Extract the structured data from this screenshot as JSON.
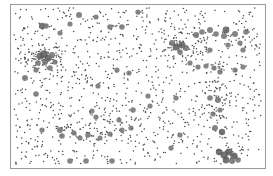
{
  "chart_data": {
    "type": "scatter",
    "title": "",
    "xlabel": "",
    "ylabel": "",
    "grid": false,
    "legend": null,
    "axes_visible": false,
    "frame": {
      "x": 10,
      "y": 4,
      "width": 255,
      "height": 164
    },
    "colors": {
      "frame": "#9a9a9a",
      "small_point": "#4a4a4a",
      "large_point": "#707070",
      "large_point_dark": "#5a5a5a",
      "background": "#ffffff"
    },
    "note": "Unlabeled point-pattern scatter. Coordinates are approximate pixel positions estimated from the screenshot. Large points are manual estimates of the visible gray blobs; the background small-point layer is generated from a seed and only approximates density, not exact positions.",
    "large_points": [
      [
        42,
        26,
        3.2
      ],
      [
        46,
        26,
        2.8
      ],
      [
        60,
        33,
        2.6
      ],
      [
        70,
        24,
        2.6
      ],
      [
        79,
        15,
        3.0
      ],
      [
        96,
        17,
        2.6
      ],
      [
        110,
        27,
        2.8
      ],
      [
        122,
        27,
        2.8
      ],
      [
        138,
        12,
        2.6
      ],
      [
        40,
        56,
        3.5
      ],
      [
        44,
        54,
        3.8
      ],
      [
        48,
        58,
        3.6
      ],
      [
        52,
        55,
        3.0
      ],
      [
        45,
        62,
        3.0
      ],
      [
        38,
        63,
        2.8
      ],
      [
        55,
        62,
        2.6
      ],
      [
        36,
        70,
        2.6
      ],
      [
        50,
        68,
        2.8
      ],
      [
        25,
        78,
        3.0
      ],
      [
        117,
        70,
        2.6
      ],
      [
        129,
        73,
        2.6
      ],
      [
        98,
        86,
        2.6
      ],
      [
        172,
        43,
        3.0
      ],
      [
        176,
        47,
        3.4
      ],
      [
        182,
        45,
        3.6
      ],
      [
        186,
        48,
        3.0
      ],
      [
        180,
        52,
        2.8
      ],
      [
        196,
        35,
        3.0
      ],
      [
        202,
        32,
        2.8
      ],
      [
        210,
        30,
        3.0
      ],
      [
        216,
        34,
        2.8
      ],
      [
        224,
        36,
        3.0
      ],
      [
        226,
        30,
        3.4
      ],
      [
        235,
        34,
        3.0
      ],
      [
        228,
        45,
        2.6
      ],
      [
        240,
        43,
        2.6
      ],
      [
        243,
        50,
        2.6
      ],
      [
        246,
        32,
        2.8
      ],
      [
        210,
        50,
        2.6
      ],
      [
        190,
        63,
        2.6
      ],
      [
        198,
        67,
        2.6
      ],
      [
        206,
        66,
        2.6
      ],
      [
        214,
        68,
        2.6
      ],
      [
        220,
        72,
        2.6
      ],
      [
        235,
        70,
        2.6
      ],
      [
        243,
        67,
        2.6
      ],
      [
        36,
        94,
        2.8
      ],
      [
        92,
        111,
        2.6
      ],
      [
        96,
        117,
        2.6
      ],
      [
        119,
        120,
        2.6
      ],
      [
        60,
        130,
        3.0
      ],
      [
        62,
        136,
        2.8
      ],
      [
        74,
        133,
        2.6
      ],
      [
        80,
        138,
        2.6
      ],
      [
        88,
        135,
        2.8
      ],
      [
        100,
        138,
        2.6
      ],
      [
        110,
        134,
        2.6
      ],
      [
        122,
        130,
        2.6
      ],
      [
        131,
        128,
        2.6
      ],
      [
        133,
        110,
        2.8
      ],
      [
        150,
        106,
        2.6
      ],
      [
        42,
        130,
        2.6
      ],
      [
        70,
        161,
        2.8
      ],
      [
        86,
        161,
        2.8
      ],
      [
        112,
        161,
        2.8
      ],
      [
        148,
        96,
        2.6
      ],
      [
        176,
        98,
        2.6
      ],
      [
        210,
        98,
        2.8
      ],
      [
        218,
        100,
        3.0
      ],
      [
        213,
        114,
        2.6
      ],
      [
        220,
        110,
        2.6
      ],
      [
        215,
        128,
        3.0
      ],
      [
        222,
        132,
        3.2
      ],
      [
        180,
        135,
        2.6
      ],
      [
        171,
        148,
        2.6
      ],
      [
        219,
        152,
        3.2
      ],
      [
        224,
        155,
        3.6
      ],
      [
        229,
        152,
        3.4
      ],
      [
        234,
        156,
        3.6
      ],
      [
        226,
        160,
        3.4
      ],
      [
        232,
        161,
        3.0
      ],
      [
        238,
        160,
        2.8
      ]
    ],
    "small_point_count": 1050,
    "small_point_radius": 0.75,
    "random_seed": 7,
    "dense_regions": [
      {
        "cx": 44,
        "cy": 58,
        "rx": 20,
        "ry": 14,
        "count": 60
      },
      {
        "cx": 185,
        "cy": 45,
        "rx": 25,
        "ry": 14,
        "count": 60
      },
      {
        "cx": 215,
        "cy": 100,
        "rx": 16,
        "ry": 20,
        "count": 50
      },
      {
        "cx": 90,
        "cy": 130,
        "rx": 35,
        "ry": 12,
        "count": 50
      },
      {
        "cx": 228,
        "cy": 155,
        "rx": 14,
        "ry": 8,
        "count": 25
      }
    ]
  }
}
